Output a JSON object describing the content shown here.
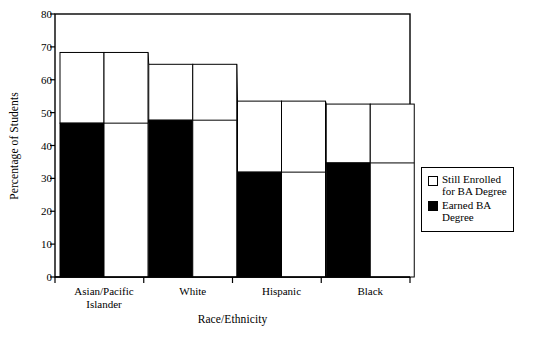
{
  "chart_data": {
    "type": "bar",
    "title": "",
    "xlabel": "Race/Ethnicity",
    "ylabel": "Percentage of Students",
    "categories": [
      "Asian/Pacific\nIslander",
      "White",
      "Hispanic",
      "Black"
    ],
    "ylim": [
      0,
      80
    ],
    "yticks": [
      0,
      10,
      20,
      30,
      40,
      50,
      60,
      70,
      80
    ],
    "grid": false,
    "legend_position": "right",
    "series": [
      {
        "name": "Earned BA\nDegree",
        "color": "#000000",
        "values": [
          46.8,
          47.7,
          31.9,
          34.7
        ]
      },
      {
        "name": "Still Enrolled\nfor BA Degree",
        "color": "#ffffff",
        "values": [
          21.5,
          17.0,
          21.6,
          17.9
        ]
      }
    ],
    "cumulative_totals": [
      68.3,
      64.7,
      53.5,
      52.6
    ]
  },
  "axis": {
    "ytick_labels": [
      "80",
      "70",
      "60",
      "50",
      "40",
      "30",
      "20",
      "10",
      "0"
    ],
    "ylabel_text": "Percentage of Students",
    "xlabel_text": "Race/Ethnicity",
    "xtick_labels": [
      "Asian/Pacific\nIslander",
      "White",
      "Hispanic",
      "Black"
    ]
  },
  "legend": {
    "items": [
      {
        "label": "Still Enrolled\nfor BA Degree",
        "swatch": "hollow"
      },
      {
        "label": "Earned BA\nDegree",
        "swatch": "filled"
      }
    ]
  }
}
